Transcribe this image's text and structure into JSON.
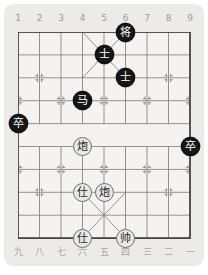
{
  "game": {
    "name": "xiangqi-board",
    "title": "Xiangqi Board",
    "board": {
      "files": 9,
      "ranks": 10,
      "file_labels_top": [
        "1",
        "2",
        "3",
        "4",
        "5",
        "6",
        "7",
        "8",
        "9"
      ],
      "file_labels_bottom": [
        "九",
        "八",
        "七",
        "六",
        "五",
        "四",
        "三",
        "二",
        "一"
      ],
      "colors": {
        "background": "#ecebe9",
        "board_fill": "#f4f3f1",
        "line": "#7a7a7a",
        "border": "#3a3a3a",
        "black_piece_bg": "#171717",
        "black_piece_text": "#ffffff",
        "red_piece_bg": "#e9e8e6",
        "red_piece_text": "#2a2a2a",
        "label_text": "#9c9c9c"
      }
    },
    "pieces": [
      {
        "id": "p1",
        "glyph": "将",
        "name": "black-general",
        "side": "black",
        "file": 6,
        "rank": 1
      },
      {
        "id": "p2",
        "glyph": "士",
        "name": "black-advisor-left",
        "side": "black",
        "file": 5,
        "rank": 2
      },
      {
        "id": "p3",
        "glyph": "士",
        "name": "black-advisor-right",
        "side": "black",
        "file": 6,
        "rank": 3
      },
      {
        "id": "p4",
        "glyph": "马",
        "name": "black-horse",
        "side": "black",
        "file": 4,
        "rank": 4
      },
      {
        "id": "p5",
        "glyph": "卒",
        "name": "black-pawn-left",
        "side": "black",
        "file": 1,
        "rank": 5
      },
      {
        "id": "p6",
        "glyph": "卒",
        "name": "black-pawn-right",
        "side": "black",
        "file": 9,
        "rank": 6
      },
      {
        "id": "p7",
        "glyph": "炮",
        "name": "red-cannon-upper",
        "side": "red",
        "file": 4,
        "rank": 6
      },
      {
        "id": "p8",
        "glyph": "仕",
        "name": "red-advisor-upper",
        "side": "red",
        "file": 4,
        "rank": 8
      },
      {
        "id": "p9",
        "glyph": "炮",
        "name": "red-cannon-lower",
        "side": "red",
        "file": 5,
        "rank": 8
      },
      {
        "id": "p10",
        "glyph": "仕",
        "name": "red-advisor-lower",
        "side": "red",
        "file": 4,
        "rank": 10
      },
      {
        "id": "p11",
        "glyph": "帅",
        "name": "red-general",
        "side": "red",
        "file": 6,
        "rank": 10
      }
    ]
  }
}
